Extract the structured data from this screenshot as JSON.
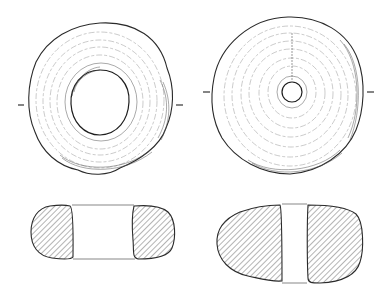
{
  "figure": {
    "objects": [
      {
        "id": "whorl-1",
        "view": "plan",
        "perforation": "large",
        "section": "hatched, rounded-rectangular"
      },
      {
        "id": "whorl-2",
        "view": "plan",
        "perforation": "small",
        "section": "hatched, plano-convex"
      }
    ],
    "colors": {
      "line": "#2a2a2a",
      "background": "#ffffff"
    }
  }
}
